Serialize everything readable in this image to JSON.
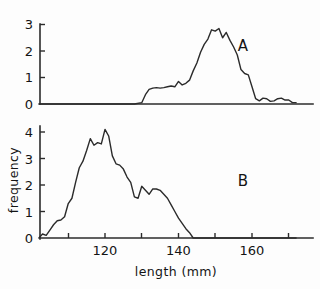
{
  "figure": {
    "background_color": "#fdfdfd",
    "line_color": "#2b2b2b",
    "text_color": "#141414"
  },
  "labels": {
    "panel_a": "A",
    "panel_b": "B",
    "y_axis_title": "frequency",
    "x_axis_title": "length (mm)"
  },
  "chart_data": {
    "type": "line",
    "title": "",
    "xlabel": "length (mm)",
    "ylabel": "frequency",
    "grid": false,
    "legend": "inline-panel-labels",
    "panels": [
      {
        "name": "A",
        "label": "A",
        "xlim": [
          102,
          172
        ],
        "ylim": [
          0,
          3
        ],
        "xticks": [
          120,
          140,
          160
        ],
        "xtick_labels": [
          "120",
          "140",
          "160"
        ],
        "yticks": [
          0,
          1,
          2,
          3
        ],
        "ytick_labels": [
          "0",
          "1",
          "2",
          "3"
        ],
        "x": [
          102,
          108,
          114,
          120,
          124,
          128,
          130,
          131,
          132,
          133,
          134,
          135,
          136,
          137,
          138,
          139,
          140,
          141,
          142,
          143,
          144,
          145,
          146,
          147,
          148,
          149,
          150,
          151,
          152,
          153,
          154,
          155,
          156,
          157,
          158,
          159,
          160,
          161,
          162,
          163,
          164,
          165,
          166,
          167,
          168,
          169,
          170,
          171,
          172
        ],
        "y": [
          0.0,
          0.0,
          0.0,
          0.0,
          0.0,
          0.0,
          0.05,
          0.35,
          0.55,
          0.6,
          0.62,
          0.6,
          0.62,
          0.65,
          0.68,
          0.65,
          0.85,
          0.72,
          0.78,
          0.9,
          1.25,
          1.55,
          1.95,
          2.25,
          2.45,
          2.8,
          2.75,
          2.85,
          2.5,
          2.7,
          2.4,
          2.15,
          1.85,
          1.3,
          1.15,
          1.1,
          0.65,
          0.2,
          0.12,
          0.22,
          0.2,
          0.1,
          0.12,
          0.2,
          0.22,
          0.15,
          0.15,
          0.05,
          0.05
        ]
      },
      {
        "name": "B",
        "label": "B",
        "xlim": [
          102,
          172
        ],
        "ylim": [
          0,
          4.5
        ],
        "xticks": [
          120,
          140,
          160
        ],
        "xtick_labels": [
          "120",
          "140",
          "160"
        ],
        "yticks": [
          0,
          1,
          2,
          3,
          4
        ],
        "ytick_labels": [
          "0",
          "1",
          "2",
          "3",
          "4"
        ],
        "x": [
          102,
          103,
          104,
          105,
          106,
          107,
          108,
          109,
          110,
          111,
          112,
          113,
          114,
          115,
          116,
          117,
          118,
          119,
          120,
          121,
          122,
          123,
          124,
          125,
          126,
          127,
          128,
          129,
          130,
          131,
          132,
          133,
          134,
          135,
          136,
          137,
          138,
          139,
          140,
          141,
          142,
          143,
          144,
          172
        ],
        "y": [
          0.0,
          0.15,
          0.1,
          0.3,
          0.5,
          0.65,
          0.68,
          0.8,
          1.3,
          1.5,
          2.1,
          2.65,
          2.9,
          3.3,
          3.75,
          3.5,
          3.6,
          3.55,
          4.1,
          3.85,
          3.1,
          2.8,
          2.75,
          2.6,
          2.3,
          2.1,
          1.55,
          1.5,
          1.95,
          1.8,
          1.65,
          1.85,
          1.85,
          1.8,
          1.65,
          1.5,
          1.25,
          1.0,
          0.75,
          0.55,
          0.35,
          0.2,
          0.0,
          0.0
        ]
      }
    ]
  }
}
